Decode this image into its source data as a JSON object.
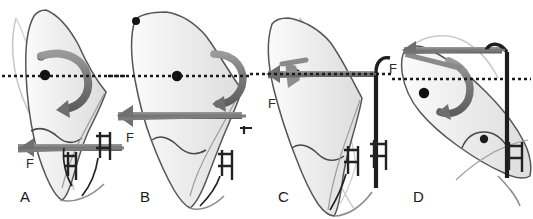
{
  "figure": {
    "type": "scientific-illustration",
    "background_color": "#ffffff",
    "width": 533,
    "height": 219,
    "reference_line": {
      "name": "occlusal-reference-line",
      "style": "dotted",
      "color": "#1a1a1a",
      "y_positions": [
        76,
        76,
        74,
        79
      ]
    },
    "colors": {
      "arrow_gray": "#7d7d7d",
      "arrow_dark": "#5a5a5a",
      "tooth_outline": "#4a4a4a",
      "tooth_fill": "#efefef",
      "tooth_ghost": "#d9d9d9",
      "appliance_black": "#1e1e1e",
      "marker_dot": "#111111",
      "label_text": "#1a1a1a",
      "dotted_line": "#1a1a1a"
    }
  },
  "panels": [
    {
      "id": "A",
      "label": "A",
      "label_x": 20,
      "label_y": 196,
      "force_label": "F",
      "force_label_x": 26,
      "force_label_y": 163,
      "force_direction": "horizontal-left",
      "rotation": "clockwise-couple",
      "description": "Uncontrolled tipping: single force at bracket with resultant rotation about centre of resistance"
    },
    {
      "id": "B",
      "label": "B",
      "label_x": 140,
      "label_y": 196,
      "force_label": "F",
      "force_label_x": 126,
      "force_label_y": 137,
      "force_direction": "horizontal-left",
      "rotation": "clockwise-couple",
      "description": "Controlled tipping: force applied closer to centre of resistance reduces rotation"
    },
    {
      "id": "C",
      "label": "C",
      "label_x": 278,
      "label_y": 196,
      "force_label": "F",
      "force_label_x": 268,
      "force_label_y": 103,
      "force_direction": "horizontal-left",
      "rotation": "none",
      "description": "Bodily translation: force line passes through centre of resistance"
    },
    {
      "id": "D",
      "label": "D",
      "label_x": 413,
      "label_y": 196,
      "force_label": "F",
      "force_label_x": 389,
      "force_label_y": 68,
      "force_direction": "horizontal-left",
      "rotation": "counter-clockwise-couple",
      "description": "Root movement / torque: tipped tooth with force above centre of resistance"
    }
  ],
  "elements": {
    "tooth": "tooth-silhouette",
    "ghost_tooth": "ghost-tooth-outline",
    "archwire": "archwire",
    "bracket": "orthodontic-bracket",
    "marker": "centre-of-resistance-marker",
    "straight_arrow": "force-arrow",
    "curved_arrow": "rotation-arrow",
    "hook": "appliance-hook"
  }
}
